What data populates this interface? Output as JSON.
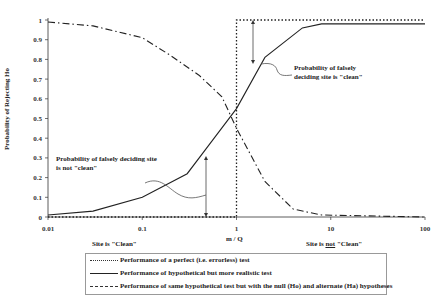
{
  "chart_data": {
    "type": "line",
    "title": "",
    "xlabel": "m / Q",
    "ylabel": "Probability of Rejecting Ho",
    "xscale": "log",
    "xlim": [
      0.01,
      100
    ],
    "ylim": [
      0,
      1
    ],
    "x_ticks": [
      "0.01",
      "0.1",
      "1",
      "10",
      "100"
    ],
    "y_ticks": [
      "0",
      "0.1",
      "0.2",
      "0.3",
      "0.4",
      "0.5",
      "0.6",
      "0.7",
      "0.8",
      "0.9",
      "1"
    ],
    "grid": false,
    "legend_position": "bottom",
    "series": [
      {
        "name": "Performance of a perfect (i.e. errorless) test",
        "style": "dotted",
        "x": [
          0.01,
          0.99,
          1.0,
          1.0,
          100
        ],
        "y": [
          0,
          0,
          0,
          1,
          1
        ]
      },
      {
        "name": "Performance of hypothetical but more  realistic test",
        "style": "solid",
        "x": [
          0.01,
          0.03,
          0.1,
          0.3,
          0.5,
          1.0,
          2.0,
          5.0,
          8.0,
          100
        ],
        "y": [
          0.01,
          0.03,
          0.1,
          0.22,
          0.36,
          0.55,
          0.81,
          0.96,
          0.98,
          0.98
        ]
      },
      {
        "name": "Performance of same hypothetical test but with the null (Ho) and alternate (Ha) hypotheses",
        "style": "dashdot",
        "x": [
          0.01,
          0.03,
          0.1,
          0.2,
          0.4,
          0.7,
          1.0,
          2.0,
          4.0,
          8.0,
          100
        ],
        "y": [
          0.99,
          0.97,
          0.91,
          0.82,
          0.72,
          0.61,
          0.45,
          0.18,
          0.04,
          0.01,
          0.0
        ]
      }
    ],
    "annotations": [
      {
        "text": "Probability of falsely deciding site is \"clean\"",
        "x": 1.8,
        "y": 0.78
      },
      {
        "text": "Probability of falsely deciding site is not \"clean\"",
        "x": 0.5,
        "y": 0.18
      },
      {
        "text": "Site  is \"Clean\"",
        "position": "below x-axis, left"
      },
      {
        "text": "Site is not \"Clean\"",
        "position": "below x-axis, right"
      }
    ]
  },
  "labels": {
    "ylabel": "Probability of Rejecting Ho",
    "xlabel": "m / Q",
    "ann_clean_line1": "Probability of falsely",
    "ann_clean_line2": "deciding site is \"clean\"",
    "ann_notclean_line1": "Probability of falsely deciding site",
    "ann_notclean_line2": "is not \"clean\"",
    "site_clean": "Site  is \"Clean\"",
    "site_not_pre": "Site is ",
    "site_not_u": "not",
    "site_not_post": " \"Clean\""
  },
  "legend": {
    "items": [
      {
        "label": "Performance of a perfect (i.e. errorless) test"
      },
      {
        "label": "Performance of hypothetical but more  realistic test"
      },
      {
        "label": "Performance of same hypothetical test but with the null (Ho) and alternate (Ha) hypotheses"
      }
    ]
  }
}
